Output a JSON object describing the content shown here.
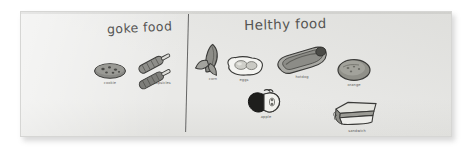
{
  "worksheet": {
    "background_color": "#ffffff",
    "paper_color": "#e9e9e7",
    "ink_color": "#4a4a4a",
    "columns": [
      {
        "id": "junk",
        "heading": "goke food",
        "items": [
          {
            "id": "cookie",
            "label": "cookie",
            "icon": "cookie-icon"
          },
          {
            "id": "popsicle",
            "label": "popsicles",
            "icon": "popsicle-icon"
          }
        ]
      },
      {
        "id": "healthy",
        "heading": "Helthy food",
        "items": [
          {
            "id": "corn",
            "label": "corn",
            "icon": "corn-icon"
          },
          {
            "id": "eggs",
            "label": "eggs",
            "icon": "fried-egg-icon"
          },
          {
            "id": "hotdog",
            "label": "hotdog",
            "icon": "hotdog-icon"
          },
          {
            "id": "orange",
            "label": "orange",
            "icon": "orange-icon"
          },
          {
            "id": "apple",
            "label": "apple",
            "icon": "apple-icon"
          },
          {
            "id": "sandwich",
            "label": "sandwich",
            "icon": "sandwich-icon"
          }
        ]
      }
    ]
  }
}
